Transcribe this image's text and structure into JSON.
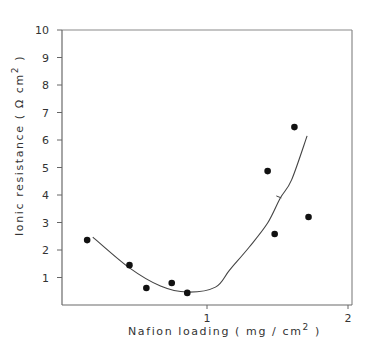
{
  "chart_data": {
    "type": "scatter",
    "title": "",
    "xlabel": "Nafion loading ( mg / cm2 )",
    "ylabel": "Ionic resistance ( Ω cm2 )",
    "xlim": [
      0,
      2
    ],
    "ylim": [
      0,
      10
    ],
    "x_ticks": [
      "1",
      "2"
    ],
    "x_tick_values": [
      1,
      2
    ],
    "y_ticks": [
      "1",
      "2",
      "3",
      "4",
      "5",
      "6",
      "7",
      "8",
      "9",
      "10"
    ],
    "y_tick_values": [
      1,
      2,
      3,
      4,
      5,
      6,
      7,
      8,
      9,
      10
    ],
    "grid": false,
    "legend": null,
    "series": [
      {
        "name": "measured",
        "kind": "scatter",
        "x": [
          0.15,
          0.45,
          0.57,
          0.75,
          0.86,
          1.43,
          1.48,
          1.62,
          1.72
        ],
        "y": [
          2.36,
          1.45,
          0.62,
          0.8,
          0.44,
          4.87,
          2.58,
          6.47,
          3.2
        ]
      },
      {
        "name": "fit",
        "kind": "line",
        "x": [
          0.19,
          0.45,
          0.67,
          0.86,
          1.06,
          1.16,
          1.3,
          1.43,
          1.52,
          1.6,
          1.71
        ],
        "y": [
          2.47,
          1.35,
          0.69,
          0.47,
          0.65,
          1.27,
          2.11,
          2.98,
          3.89,
          4.55,
          6.15
        ]
      }
    ],
    "annotations": [
      {
        "type": "tick-mark-on-curve",
        "x": 1.52,
        "y": 3.93
      }
    ]
  },
  "axes": {
    "x_label_main": "Nafion loading ( mg / cm",
    "x_label_sup": "2",
    "x_label_end": " )",
    "y_label_main": "Ionic  resistance  ( Ω cm",
    "y_label_sup": "2",
    "y_label_end": " )"
  }
}
